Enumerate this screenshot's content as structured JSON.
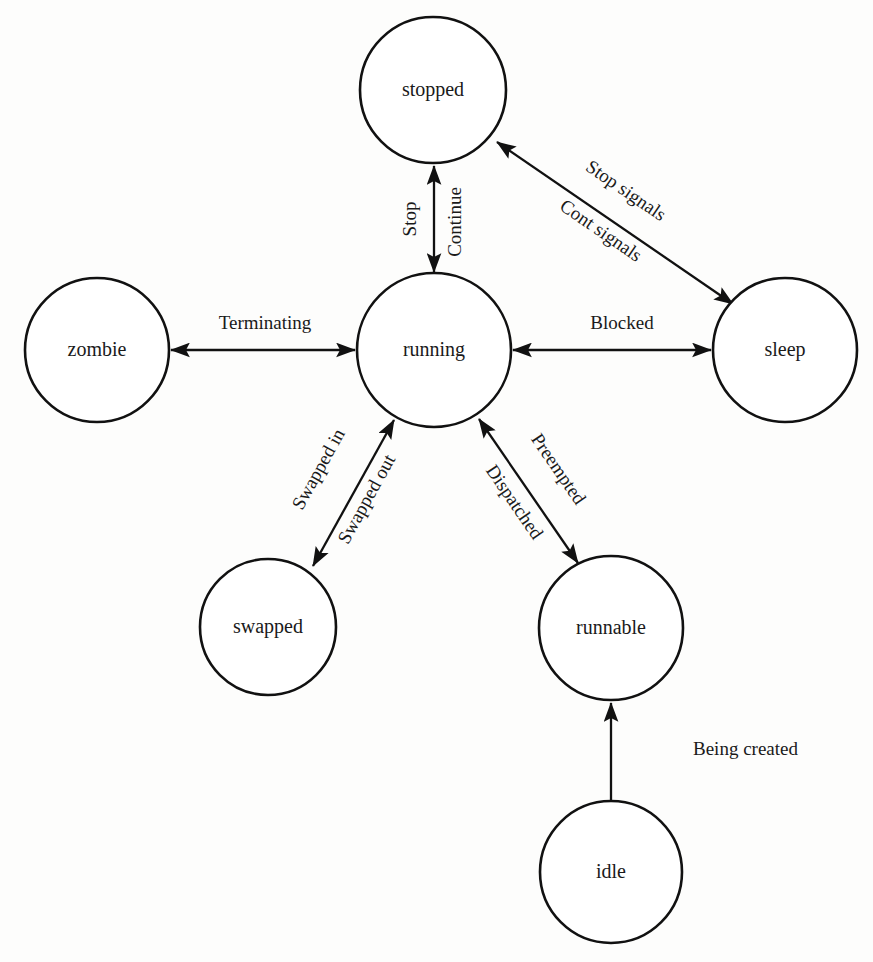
{
  "diagram": {
    "background_color": "#fdfdfc",
    "stroke_color": "#111111",
    "node_fill": "#ffffff",
    "nodes": [
      {
        "id": "stopped",
        "label": "stopped",
        "cx": 433,
        "cy": 90,
        "r": 73
      },
      {
        "id": "zombie",
        "label": "zombie",
        "cx": 97,
        "cy": 350,
        "r": 72
      },
      {
        "id": "running",
        "label": "running",
        "cx": 434,
        "cy": 350,
        "r": 77
      },
      {
        "id": "sleep",
        "label": "sleep",
        "cx": 785,
        "cy": 350,
        "r": 72
      },
      {
        "id": "swapped",
        "label": "swapped",
        "cx": 268,
        "cy": 627,
        "r": 68
      },
      {
        "id": "runnable",
        "label": "runnable",
        "cx": 611,
        "cy": 628,
        "r": 72
      },
      {
        "id": "idle",
        "label": "idle",
        "cx": 611,
        "cy": 872,
        "r": 71
      }
    ],
    "edges": [
      {
        "id": "running-stopped",
        "from": "running",
        "to": "stopped",
        "direction": "bidirectional",
        "labels": [
          "Stop",
          "Continue"
        ]
      },
      {
        "id": "stopped-sleep",
        "from": "stopped",
        "to": "sleep",
        "direction": "bidirectional",
        "labels": [
          "Stop signals",
          "Cont signals"
        ]
      },
      {
        "id": "running-zombie",
        "from": "running",
        "to": "zombie",
        "direction": "bidirectional",
        "labels": [
          "Terminating"
        ]
      },
      {
        "id": "running-sleep",
        "from": "running",
        "to": "sleep",
        "direction": "bidirectional",
        "labels": [
          "Blocked"
        ]
      },
      {
        "id": "running-swapped",
        "from": "running",
        "to": "swapped",
        "direction": "bidirectional",
        "labels": [
          "Swapped in",
          "Swapped out"
        ]
      },
      {
        "id": "running-runnable",
        "from": "running",
        "to": "runnable",
        "direction": "bidirectional",
        "labels": [
          "Preempted",
          "Dispatched"
        ]
      },
      {
        "id": "idle-runnable",
        "from": "idle",
        "to": "runnable",
        "direction": "single",
        "labels": [
          "Being created"
        ]
      }
    ],
    "labels": {
      "stop": "Stop",
      "continue": "Continue",
      "stop_signals": "Stop signals",
      "cont_signals": "Cont signals",
      "terminating": "Terminating",
      "blocked": "Blocked",
      "swapped_in": "Swapped in",
      "swapped_out": "Swapped out",
      "preempted": "Preempted",
      "dispatched": "Dispatched",
      "being_created": "Being created"
    },
    "node_labels": {
      "stopped": "stopped",
      "zombie": "zombie",
      "running": "running",
      "sleep": "sleep",
      "swapped": "swapped",
      "runnable": "runnable",
      "idle": "idle"
    }
  }
}
